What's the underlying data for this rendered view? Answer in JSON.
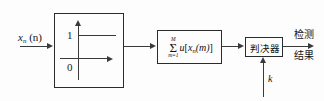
{
  "diagram": {
    "input": {
      "symbol": "x",
      "subscript": "n",
      "argument": "(n)"
    },
    "step_block": {
      "name": "unit-step-nonlinearity",
      "y_high_label": "1",
      "y_low_label": "0"
    },
    "sum_block": {
      "upper_limit": "M",
      "lower_limit": "m=1",
      "sigma": "Σ",
      "function": "u",
      "open_bracket": "[",
      "arg_symbol": "x",
      "arg_subscript": "n",
      "arg_index": "(m)",
      "close_bracket": "]",
      "full_expression": "Σ(m=1..M) u[xₙ(m)]"
    },
    "decision_block": {
      "label": "判决器"
    },
    "threshold": {
      "label": "k"
    },
    "output": {
      "line1": "检测",
      "line2": "结果"
    },
    "colors": {
      "stroke": "#2b2b2b",
      "line": "#3a3a3a",
      "text": "#111111",
      "background": "#fdfdfd"
    }
  }
}
